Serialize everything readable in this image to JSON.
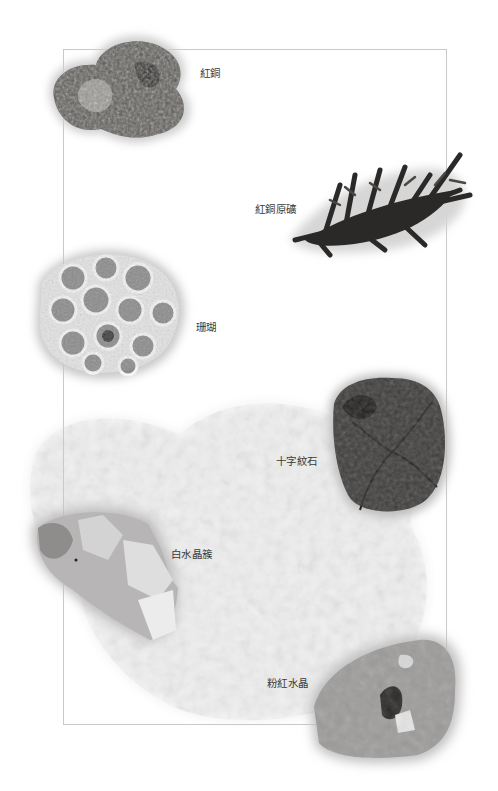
{
  "page": {
    "background": "#ffffff",
    "frame_color": "#c9c9c9"
  },
  "specimens": [
    {
      "id": "red-copper",
      "label": "紅銅",
      "icon": "red-copper-nugget-image",
      "tone": "#5a5652"
    },
    {
      "id": "red-copper-ore",
      "label": "紅銅原礦",
      "icon": "dendritic-copper-ore-image",
      "tone": "#2e2b29"
    },
    {
      "id": "coral",
      "label": "珊瑚",
      "icon": "coral-fossil-image",
      "tone": "#bdbdbd"
    },
    {
      "id": "staurolite",
      "label": "十字紋石",
      "icon": "staurolite-cross-stone-image",
      "tone": "#3c3a39"
    },
    {
      "id": "clear-quartz-cluster",
      "label": "白水晶簇",
      "icon": "clear-quartz-cluster-image",
      "tone": "#c4c2c2"
    },
    {
      "id": "rose-quartz",
      "label": "粉紅水晶",
      "icon": "rose-quartz-image",
      "tone": "#9e9c9b"
    }
  ],
  "background_specimen": {
    "icon": "white-crystal-mass-image",
    "tone": "#ececec"
  }
}
